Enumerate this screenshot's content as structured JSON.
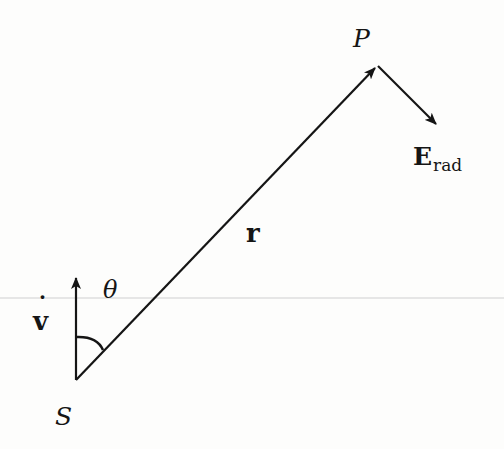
{
  "figure": {
    "labels": {
      "point_p": "P",
      "point_s": "S",
      "vector_r": "r",
      "vector_v": "v",
      "v_dot": "˙",
      "angle": "θ",
      "field_main": "E",
      "field_sub": "rad"
    },
    "geometry": {
      "source_s": [
        76,
        380
      ],
      "point_p": [
        377,
        66
      ],
      "v_tip": [
        76,
        276
      ],
      "e_tip": [
        437,
        125
      ],
      "scan_line_y": 298
    },
    "colors": {
      "ink": "#151515",
      "paper": "#fdfdfc",
      "scan_line": "#c8c8c8"
    }
  }
}
